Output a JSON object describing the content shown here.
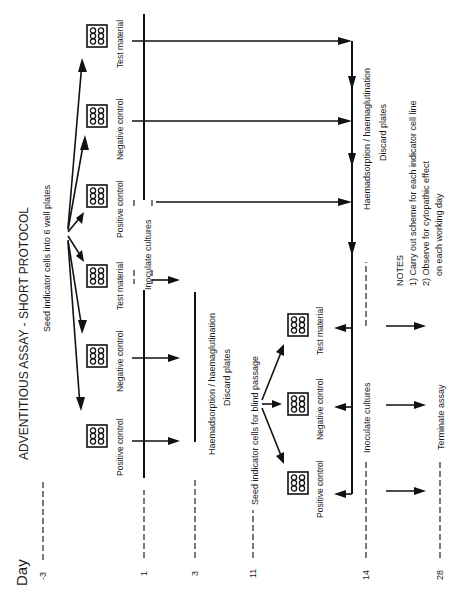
{
  "title": "ADVENTITIOUS ASSAY - SHORT PROTOCOL",
  "axis_label": "Day",
  "days": [
    {
      "label": "-3",
      "x": 43
    },
    {
      "label": "1",
      "x": 144
    },
    {
      "label": "3",
      "x": 195
    },
    {
      "label": "11",
      "x": 253
    },
    {
      "label": "14",
      "x": 366
    },
    {
      "label": "28",
      "x": 440
    }
  ],
  "steps": {
    "seed": "Seed indicator cells into 6 well plates",
    "inoculate1": "Inoculate cultures",
    "haem1": "Haemadsorption / haemaglutination",
    "discard1": "Discard plates",
    "seed_blind": "Seed indicator cells for blind passage",
    "haem2": "Haemadsorption / haemaglutination",
    "discard2": "Discard plates",
    "inoculate2": "Inoculate cultures",
    "terminate": "Terminate assay"
  },
  "plate_labels": {
    "positive": "Positive control",
    "negative": "Negative control",
    "test": "Test material"
  },
  "notes": {
    "heading": "NOTES",
    "items": [
      "1) Carry out scheme for each indicator cell line",
      "2) Observe for cytopathic effect",
      "on each working day"
    ]
  }
}
